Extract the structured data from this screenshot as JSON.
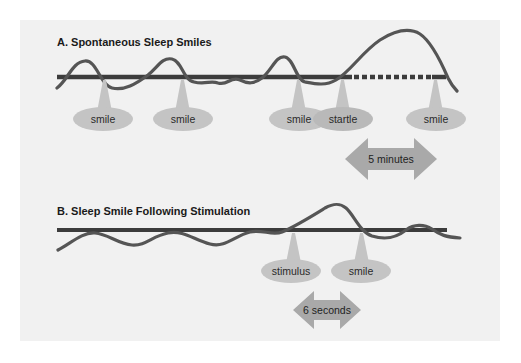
{
  "panel_a": {
    "title": "A. Spontaneous Sleep Smiles",
    "labels": [
      {
        "text": "smile"
      },
      {
        "text": "smile"
      },
      {
        "text": "smile"
      },
      {
        "text": "startle"
      },
      {
        "text": "smile"
      }
    ],
    "duration_label": "5 minutes"
  },
  "panel_b": {
    "title": "B. Sleep Smile Following Stimulation",
    "labels": [
      {
        "text": "stimulus"
      },
      {
        "text": "smile"
      }
    ],
    "duration_label": "6 seconds"
  },
  "colors": {
    "panel_bg": "#f1f1f1",
    "baseline": "#3c3c3c",
    "wave": "#555555",
    "bubble": "#c4c4c4",
    "arrow": "#a9a9a9"
  }
}
